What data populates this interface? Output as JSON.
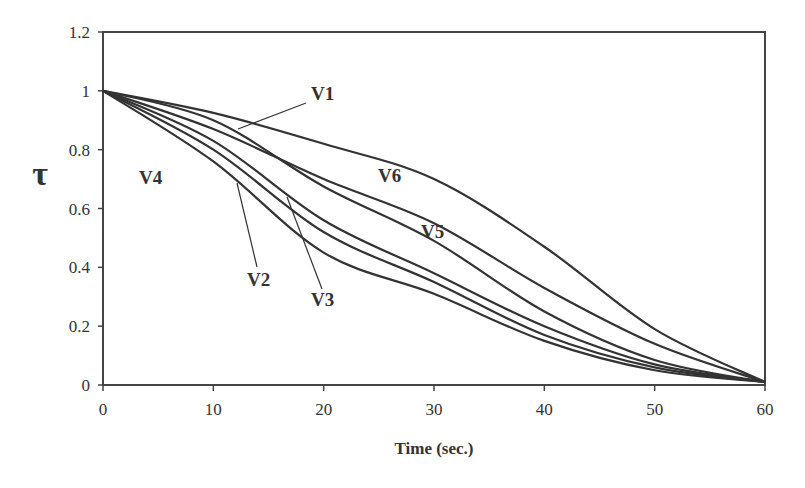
{
  "chart_data": {
    "type": "line",
    "title": "",
    "xlabel": "Time (sec.)",
    "ylabel": "τ",
    "xlim": [
      0,
      60
    ],
    "ylim": [
      0,
      1.2
    ],
    "xticks": [
      0,
      10,
      20,
      30,
      40,
      50,
      60
    ],
    "yticks": [
      0,
      0.2,
      0.4,
      0.6,
      0.8,
      1,
      1.2
    ],
    "xtick_labels": [
      "0",
      "10",
      "20",
      "30",
      "40",
      "50",
      "60"
    ],
    "ytick_labels": [
      "0",
      "0.2",
      "0.4",
      "0.6",
      "0.8",
      "1",
      "1.2"
    ],
    "grid": false,
    "legend": "none (inline labels)",
    "x": [
      0,
      10,
      20,
      30,
      40,
      50,
      60
    ],
    "series": [
      {
        "name": "V1",
        "values": [
          1,
          0.9,
          0.675,
          0.49,
          0.25,
          0.085,
          0.01
        ]
      },
      {
        "name": "V2",
        "values": [
          1,
          0.8,
          0.52,
          0.35,
          0.17,
          0.06,
          0.01
        ]
      },
      {
        "name": "V3",
        "values": [
          1,
          0.83,
          0.56,
          0.38,
          0.2,
          0.07,
          0.01
        ]
      },
      {
        "name": "V4",
        "values": [
          1,
          0.76,
          0.45,
          0.31,
          0.15,
          0.05,
          0.01
        ]
      },
      {
        "name": "V5",
        "values": [
          1,
          0.87,
          0.7,
          0.55,
          0.33,
          0.14,
          0.01
        ]
      },
      {
        "name": "V6",
        "values": [
          1,
          0.925,
          0.82,
          0.7,
          0.47,
          0.19,
          0.01
        ]
      }
    ],
    "annotations": [
      {
        "text": "V1",
        "x": 311,
        "y": 100,
        "leader": [
          306,
          103,
          238,
          129
        ]
      },
      {
        "text": "V2",
        "x": 247,
        "y": 286,
        "leader": [
          257,
          267,
          237,
          183
        ]
      },
      {
        "text": "V3",
        "x": 311,
        "y": 306,
        "leader": [
          322,
          289,
          287,
          197
        ]
      },
      {
        "text": "V4",
        "x": 139,
        "y": 184
      },
      {
        "text": "V5",
        "x": 421,
        "y": 238
      },
      {
        "text": "V6",
        "x": 378,
        "y": 182
      }
    ],
    "line_color": "#333333"
  }
}
